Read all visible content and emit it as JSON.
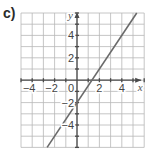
{
  "part_label": "c)",
  "chart_data": {
    "type": "line",
    "title": "",
    "xlabel": "x",
    "ylabel": "y",
    "xlim": [
      -5,
      6
    ],
    "ylim": [
      -6,
      6
    ],
    "grid": true,
    "x_ticks": [
      -4,
      -2,
      0,
      2,
      4
    ],
    "y_ticks": [
      -4,
      -2,
      2,
      4
    ],
    "x_tick_labels": [
      "−4",
      "−2",
      "0",
      "2",
      "4"
    ],
    "y_tick_labels": [
      "−4",
      "−2",
      "2",
      "4"
    ],
    "origin_label": "0",
    "series": [
      {
        "name": "line",
        "equation": "y = 1.5x - 2",
        "slope": 1.5,
        "intercept": -2,
        "x": [
          -2.667,
          5.333
        ],
        "y": [
          -6,
          6
        ]
      }
    ],
    "colors": {
      "grid": "#b8b8b8",
      "axis": "#4a4a4a",
      "line": "#6a6a6a",
      "text": "#444444"
    }
  }
}
